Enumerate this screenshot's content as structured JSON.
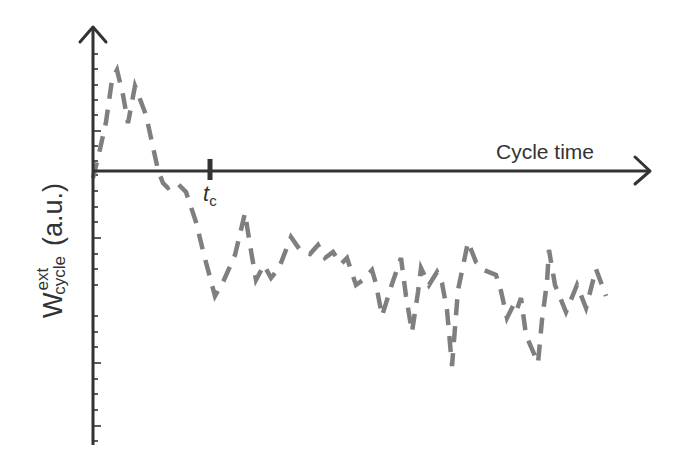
{
  "chart_data": {
    "type": "line",
    "title": "",
    "xlabel": "Cycle time",
    "ylabel": "W_cycle^ext (a.u.)",
    "ylabel_parts": {
      "main": "W",
      "superscript": "ext",
      "subscript": "cycle",
      "unit": "(a.u.)"
    },
    "annotations": [
      {
        "label": "t",
        "subscript": "c",
        "x_px": 210
      }
    ],
    "grid": false,
    "legend": null,
    "axis_style": "arrowed axes, origin at left; y ticks unlabeled",
    "series": [
      {
        "name": "W_cycle^ext",
        "style": "dashed grey",
        "color": "#7f7f7f",
        "points_px": [
          [
            93,
            178
          ],
          [
            98,
            158
          ],
          [
            106,
            122
          ],
          [
            112,
            80
          ],
          [
            117,
            70
          ],
          [
            123,
            95
          ],
          [
            128,
            123
          ],
          [
            135,
            86
          ],
          [
            146,
            115
          ],
          [
            158,
            170
          ],
          [
            163,
            183
          ],
          [
            168,
            188
          ],
          [
            177,
            183
          ],
          [
            186,
            192
          ],
          [
            196,
            222
          ],
          [
            204,
            255
          ],
          [
            215,
            296
          ],
          [
            224,
            280
          ],
          [
            235,
            255
          ],
          [
            245,
            213
          ],
          [
            250,
            245
          ],
          [
            256,
            280
          ],
          [
            264,
            265
          ],
          [
            271,
            278
          ],
          [
            279,
            268
          ],
          [
            291,
            237
          ],
          [
            300,
            250
          ],
          [
            310,
            254
          ],
          [
            318,
            245
          ],
          [
            325,
            258
          ],
          [
            333,
            252
          ],
          [
            341,
            264
          ],
          [
            347,
            258
          ],
          [
            356,
            285
          ],
          [
            363,
            280
          ],
          [
            372,
            270
          ],
          [
            376,
            284
          ],
          [
            382,
            316
          ],
          [
            392,
            284
          ],
          [
            401,
            258
          ],
          [
            406,
            296
          ],
          [
            412,
            332
          ],
          [
            418,
            292
          ],
          [
            421,
            268
          ],
          [
            429,
            285
          ],
          [
            437,
            272
          ],
          [
            442,
            283
          ],
          [
            447,
            310
          ],
          [
            452,
            366
          ],
          [
            458,
            290
          ],
          [
            468,
            242
          ],
          [
            476,
            262
          ],
          [
            484,
            270
          ],
          [
            496,
            275
          ],
          [
            501,
            291
          ],
          [
            507,
            318
          ],
          [
            513,
            306
          ],
          [
            516,
            312
          ],
          [
            521,
            298
          ],
          [
            526,
            335
          ],
          [
            538,
            363
          ],
          [
            542,
            320
          ],
          [
            547,
            282
          ],
          [
            549,
            250
          ],
          [
            555,
            285
          ],
          [
            566,
            312
          ],
          [
            577,
            285
          ],
          [
            586,
            308
          ],
          [
            596,
            269
          ],
          [
            606,
            296
          ]
        ]
      }
    ]
  },
  "axes": {
    "x": {
      "label": "Cycle time",
      "y_px": 171,
      "x_start": 92,
      "x_end": 650
    },
    "y": {
      "x_px": 93,
      "y_top": 27,
      "y_bottom": 445
    }
  },
  "y_ticks_px": [
    54,
    69,
    85,
    100,
    115,
    131,
    146,
    161,
    175,
    191,
    207,
    222,
    238,
    254,
    269,
    285,
    316,
    332,
    347,
    363,
    379,
    394,
    410,
    426,
    441
  ],
  "y_ticks_long_px": [
    131,
    238,
    363,
    426
  ]
}
